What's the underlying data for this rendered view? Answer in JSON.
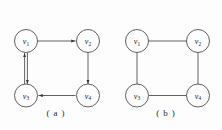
{
  "figure": {
    "background_color": "#fdfdfd",
    "stroke_color": "#3a3a3a",
    "label_color": "#1f1f1f",
    "panels": [
      {
        "id": "a",
        "caption": "( a )",
        "graph_type": "directed",
        "nodes": [
          {
            "id": "v1",
            "label": "v",
            "subscript": "1",
            "position": "top-left"
          },
          {
            "id": "v2",
            "label": "v",
            "subscript": "2",
            "position": "top-right"
          },
          {
            "id": "v3",
            "label": "v",
            "subscript": "3",
            "position": "bottom-left"
          },
          {
            "id": "v4",
            "label": "v",
            "subscript": "4",
            "position": "bottom-right"
          }
        ],
        "edges": [
          {
            "from": "v1",
            "to": "v2",
            "style": "arrow",
            "direction": "right"
          },
          {
            "from": "v2",
            "to": "v4",
            "style": "arrow",
            "direction": "down"
          },
          {
            "from": "v4",
            "to": "v3",
            "style": "arrow",
            "direction": "left"
          },
          {
            "from": "v3",
            "to": "v1",
            "style": "arrow",
            "direction": "up",
            "parallel_pair": "true"
          },
          {
            "from": "v1",
            "to": "v3",
            "style": "arrow",
            "direction": "down",
            "parallel_pair": "true"
          }
        ]
      },
      {
        "id": "b",
        "caption": "( b )",
        "graph_type": "undirected",
        "nodes": [
          {
            "id": "v1",
            "label": "v",
            "subscript": "1",
            "position": "top-left"
          },
          {
            "id": "v2",
            "label": "v",
            "subscript": "2",
            "position": "top-right"
          },
          {
            "id": "v3",
            "label": "v",
            "subscript": "3",
            "position": "bottom-left"
          },
          {
            "id": "v4",
            "label": "v",
            "subscript": "4",
            "position": "bottom-right"
          }
        ],
        "edges": [
          {
            "from": "v1",
            "to": "v2",
            "style": "plain"
          },
          {
            "from": "v2",
            "to": "v4",
            "style": "plain"
          },
          {
            "from": "v3",
            "to": "v4",
            "style": "plain"
          },
          {
            "from": "v1",
            "to": "v3",
            "style": "plain"
          }
        ]
      }
    ]
  }
}
